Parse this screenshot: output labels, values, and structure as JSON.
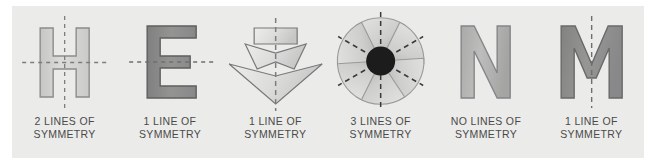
{
  "figure": {
    "background_color": "#ffffff",
    "panel_color": "#ebebe9",
    "caption_color": "#4a4a4a",
    "dash_color": "#7d7d7d"
  },
  "items": [
    {
      "shape_name": "letter-H",
      "glyph": "H",
      "fill": "#d2d2d0",
      "stroke": "#8c8c8a",
      "lines_of_symmetry": 2,
      "symmetry_axes": [
        "vertical",
        "horizontal"
      ],
      "caption_line1": "2 LINES OF",
      "caption_line2": "SYMMETRY"
    },
    {
      "shape_name": "letter-E",
      "glyph": "E",
      "fill": "#8d8d8b",
      "stroke": "#5f5f5d",
      "lines_of_symmetry": 1,
      "symmetry_axes": [
        "horizontal"
      ],
      "caption_line1": "1 LINE OF",
      "caption_line2": "SYMMETRY"
    },
    {
      "shape_name": "arrow-tree",
      "glyph": "",
      "fill": "#dcdcda",
      "stroke": "#78787a",
      "lines_of_symmetry": 1,
      "symmetry_axes": [
        "vertical"
      ],
      "caption_line1": "1 LINE OF",
      "caption_line2": "SYMMETRY"
    },
    {
      "shape_name": "six-petal-flower",
      "glyph": "",
      "fill": "#c9c9c7",
      "stroke": "#9a9a98",
      "center_fill": "#1c1c1c",
      "petal_count": 6,
      "lines_of_symmetry": 3,
      "symmetry_axes": [
        "vertical",
        "diagonal-left",
        "diagonal-right"
      ],
      "caption_line1": "3 LINES OF",
      "caption_line2": "SYMMETRY"
    },
    {
      "shape_name": "letter-N",
      "glyph": "N",
      "fill": "#b2b2b0",
      "stroke": "#85858a",
      "lines_of_symmetry": 0,
      "symmetry_axes": [],
      "caption_line1": "NO LINES OF",
      "caption_line2": "SYMMETRY"
    },
    {
      "shape_name": "letter-M",
      "glyph": "M",
      "fill": "#8d8d8b",
      "stroke": "#6a6a68",
      "lines_of_symmetry": 1,
      "symmetry_axes": [
        "vertical"
      ],
      "caption_line1": "1 LINE OF",
      "caption_line2": "SYMMETRY"
    }
  ]
}
